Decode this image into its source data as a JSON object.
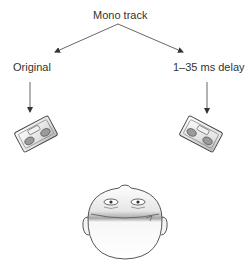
{
  "diagram": {
    "source_label": "Mono track",
    "left_label": "Original",
    "right_label": "1–35 ms delay",
    "nodes": [
      {
        "id": "mono-track",
        "label": "Mono track"
      },
      {
        "id": "original",
        "label": "Original"
      },
      {
        "id": "delayed",
        "label": "1–35 ms delay"
      },
      {
        "id": "left-speaker",
        "label": ""
      },
      {
        "id": "right-speaker",
        "label": ""
      },
      {
        "id": "listener-head",
        "label": ""
      }
    ],
    "edges": [
      {
        "from": "mono-track",
        "to": "original"
      },
      {
        "from": "mono-track",
        "to": "delayed"
      },
      {
        "from": "original",
        "to": "left-speaker"
      },
      {
        "from": "delayed",
        "to": "right-speaker"
      }
    ],
    "colors": {
      "line": "#555555",
      "text": "#333333",
      "outline": "#444444",
      "fill_light": "#f2f2f2",
      "fill_shade": "#bdbdbd"
    }
  }
}
